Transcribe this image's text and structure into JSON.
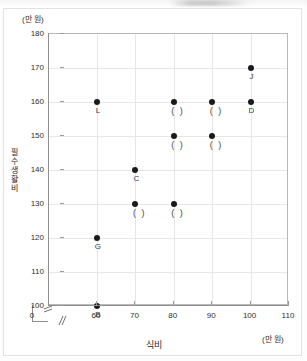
{
  "chart_data": {
    "type": "scatter",
    "title": "",
    "xlabel": "식비",
    "ylabel": "필수생활비",
    "x_unit": "(만 원)",
    "y_unit": "(만 원)",
    "xlim": [
      55,
      110
    ],
    "ylim": [
      96,
      180
    ],
    "x_ticks": [
      0,
      60,
      70,
      80,
      90,
      100,
      110
    ],
    "y_ticks": [
      100,
      110,
      120,
      130,
      140,
      150,
      160,
      170,
      180
    ],
    "grid": true,
    "legend": "none",
    "axis_break_x": true,
    "axis_break_y": true,
    "points": [
      {
        "label": "L",
        "x": 60,
        "y": 160,
        "label_pos": "below"
      },
      {
        "label": "C",
        "x": 70,
        "y": 140,
        "label_pos": "below"
      },
      {
        "label": "G",
        "x": 60,
        "y": 120,
        "label_pos": "below"
      },
      {
        "label": "B",
        "x": 60,
        "y": 100,
        "label_pos": "below"
      },
      {
        "label": "J",
        "x": 100,
        "y": 170,
        "label_pos": "below"
      },
      {
        "label": "D",
        "x": 100,
        "y": 160,
        "label_pos": "below"
      },
      {
        "label": "( )",
        "x": 80,
        "y": 160,
        "label_pos": "below"
      },
      {
        "label": "( )",
        "x": 90,
        "y": 160,
        "label_pos": "below"
      },
      {
        "label": "( )",
        "x": 80,
        "y": 150,
        "label_pos": "below"
      },
      {
        "label": "( )",
        "x": 90,
        "y": 150,
        "label_pos": "below"
      },
      {
        "label": "( )",
        "x": 70,
        "y": 130,
        "label_pos": "below"
      },
      {
        "label": "( )",
        "x": 80,
        "y": 130,
        "label_pos": "below"
      }
    ],
    "colors": {
      "point": "#1a1a1a",
      "grid": "#e6e6e6",
      "frame": "#b9b9b9",
      "axis": "#8f8f8f",
      "text": "#2f2f2f",
      "background": "#ffffff"
    }
  },
  "marks": {
    "break_glyph": "≠"
  }
}
